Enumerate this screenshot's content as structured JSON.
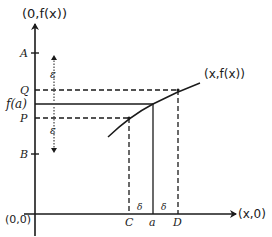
{
  "diagram": {
    "type": "epsilon-delta continuity diagram",
    "colors": {
      "ink": "#1a1a1a",
      "background": "#ffffff"
    },
    "axes": {
      "y_label": "(0,f(x))",
      "x_label": "(x,0)",
      "origin_label": "(0,0)"
    },
    "y_ticks": {
      "A": "A",
      "Q": "Q",
      "f_a": "f(a)",
      "P": "P",
      "B": "B"
    },
    "x_ticks": {
      "C": "C",
      "a": "a",
      "D": "D"
    },
    "epsilon_upper": "ε",
    "epsilon_lower": "ε",
    "delta_left": "δ",
    "delta_right": "δ",
    "curve_label": "(x,f(x))"
  }
}
